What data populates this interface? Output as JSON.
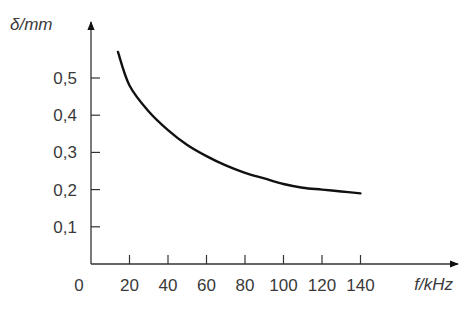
{
  "chart_data": {
    "type": "line",
    "title": "",
    "xlabel": "f/kHz",
    "ylabel": "δ/mm",
    "xlim": [
      0,
      150
    ],
    "ylim": [
      0,
      0.6
    ],
    "grid": false,
    "legend": null,
    "x_ticks": [
      0,
      20,
      40,
      60,
      80,
      100,
      120,
      140
    ],
    "x_tick_labels": [
      "0",
      "20",
      "40",
      "60",
      "80",
      "100",
      "120",
      "140"
    ],
    "y_ticks": [
      0.1,
      0.2,
      0.3,
      0.4,
      0.5
    ],
    "y_tick_labels": [
      "0,1",
      "0,2",
      "0,3",
      "0,4",
      "0,5"
    ],
    "series": [
      {
        "name": "δ(f)",
        "x": [
          14,
          20,
          30,
          40,
          50,
          60,
          70,
          80,
          90,
          100,
          110,
          120,
          130,
          140
        ],
        "values": [
          0.57,
          0.48,
          0.41,
          0.36,
          0.32,
          0.29,
          0.265,
          0.245,
          0.23,
          0.215,
          0.205,
          0.2,
          0.195,
          0.19
        ]
      }
    ]
  }
}
